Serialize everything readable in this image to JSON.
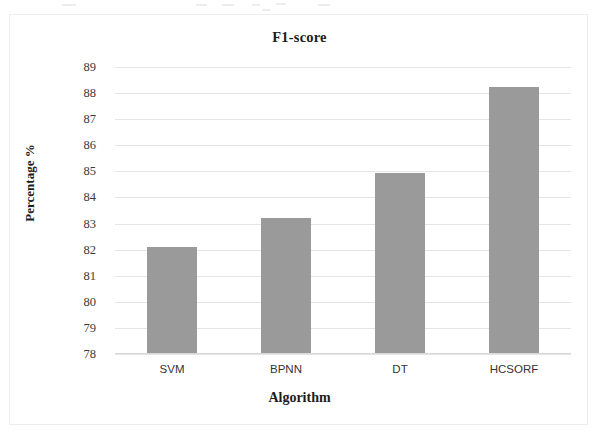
{
  "chart_data": {
    "type": "bar",
    "title": "F1-score",
    "xlabel": "Algorithm",
    "ylabel": "Percentage %",
    "categories": [
      "SVM",
      "BPNN",
      "DT",
      "HCSORF"
    ],
    "values": [
      82.1,
      83.2,
      84.95,
      88.25
    ],
    "ylim": [
      78,
      89
    ],
    "ytick_labels": [
      "89",
      "88",
      "87",
      "86",
      "85",
      "84",
      "83",
      "82",
      "81",
      "80",
      "79",
      "78"
    ],
    "ytick_values": [
      89,
      88,
      87,
      86,
      85,
      84,
      83,
      82,
      81,
      80,
      79,
      78
    ],
    "grid": true,
    "legend": null,
    "series": [
      {
        "name": "F1-score",
        "color": "#9a9a9a",
        "values": [
          82.1,
          83.2,
          84.95,
          88.25
        ]
      }
    ]
  },
  "figure": {
    "title": "F1-score",
    "x_axis_title": "Algorithm",
    "y_axis_title": "Percentage %"
  }
}
